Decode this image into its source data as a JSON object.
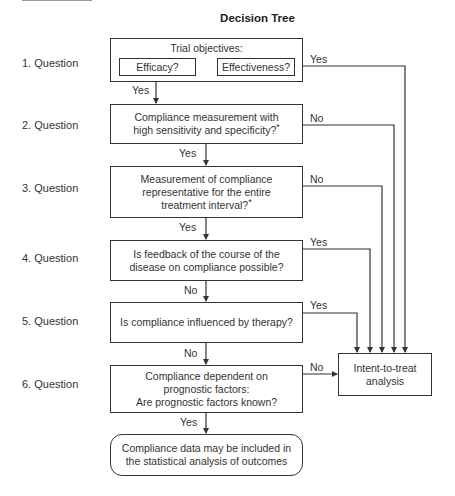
{
  "title": "Decision Tree",
  "questions": [
    {
      "label": "1.  Question"
    },
    {
      "label": "2.  Question"
    },
    {
      "label": "3.  Question"
    },
    {
      "label": "4.  Question"
    },
    {
      "label": "5.  Question"
    },
    {
      "label": "6.  Question"
    }
  ],
  "nodes": {
    "q1": {
      "heading": "Trial objectives:",
      "option_a": "Efficacy?",
      "option_b": "Effectiveness?"
    },
    "q2": {
      "line1": "Compliance measurement with",
      "line2": "high sensitivity and specificity?",
      "footnote": "*"
    },
    "q3": {
      "line1": "Measurement of compliance",
      "line2": "representative for the entire",
      "line3": "treatment interval?",
      "footnote": "*"
    },
    "q4": {
      "line1": "Is feedback of the course of the",
      "line2": "disease on compliance possible?"
    },
    "q5": {
      "line1": "Is compliance influenced by therapy?"
    },
    "q6": {
      "line1": "Compliance dependent on",
      "line2": "prognostic factors:",
      "line3": "Are prognostic factors known?"
    },
    "itt": {
      "line1": "Intent-to-treat",
      "line2": "analysis"
    },
    "final": {
      "line1": "Compliance data may be included in",
      "line2": "the statistical analysis of outcomes"
    }
  },
  "edges": {
    "q1_efficacy_yes": "Yes",
    "q1_effectiveness_yes": "Yes",
    "q2_yes": "Yes",
    "q2_no": "No",
    "q3_yes": "Yes",
    "q3_no": "No",
    "q4_yes": "Yes",
    "q4_no": "No",
    "q5_yes": "Yes",
    "q5_no": "No",
    "q6_yes": "Yes",
    "q6_no": "No"
  }
}
